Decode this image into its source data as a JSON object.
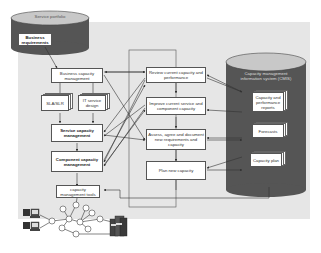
{
  "diagram": {
    "service_portfolio": {
      "title": "Service portfolio",
      "item": "Business requirements"
    },
    "left_column": {
      "business_capacity": "Business capacity management",
      "sla_slr": "SLA/SLR",
      "it_service_design": "IT service design",
      "service_capacity": "Service capacity management",
      "component_capacity": "Component capacity management",
      "tools": "capacity management tools"
    },
    "process_column": {
      "review": "Review current capacity and performance",
      "improve": "Improve current service and component capacity",
      "assess": "Assess, agree and document new requirements and capacity",
      "plan": "Plan new capacity"
    },
    "cmis": {
      "title": "Capacity management information system (CMIS)",
      "items": [
        "Capacity and performance reports",
        "Forecasts",
        "Capacity plan"
      ]
    },
    "colors": {
      "cylinder_body": "#555555",
      "cylinder_top": "#c8c8c8",
      "panel": "#e6e6e6",
      "box_border": "#555555"
    }
  }
}
